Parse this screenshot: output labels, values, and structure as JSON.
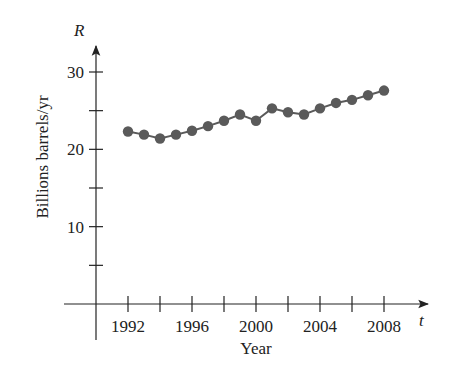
{
  "chart_data": {
    "type": "line",
    "title": "",
    "xlabel": "Year",
    "ylabel": "Billions barrels/yr",
    "x_axis_var": "t",
    "y_axis_var": "R",
    "x": [
      1992,
      1993,
      1994,
      1995,
      1996,
      1997,
      1998,
      1999,
      2000,
      2001,
      2002,
      2003,
      2004,
      2005,
      2006,
      2007,
      2008
    ],
    "series": [
      {
        "name": "R",
        "values": [
          22.3,
          21.9,
          21.4,
          21.9,
          22.4,
          23.0,
          23.7,
          24.5,
          23.7,
          25.3,
          24.8,
          24.5,
          25.3,
          26.0,
          26.4,
          27.0,
          27.6
        ]
      }
    ],
    "x_ticks": [
      1992,
      1994,
      1996,
      1998,
      2000,
      2002,
      2004,
      2006,
      2008
    ],
    "x_tick_labels": [
      "1992",
      "1996",
      "2000",
      "2004",
      "2008"
    ],
    "y_ticks": [
      5,
      10,
      15,
      20,
      25,
      30
    ],
    "y_tick_labels": [
      "10",
      "20",
      "30"
    ],
    "xlim": [
      1990,
      2010
    ],
    "ylim": [
      0,
      33
    ],
    "grid": false,
    "legend": null,
    "colors": {
      "marker": "#5a5a5a",
      "line": "#5a5a5a",
      "axis": "#222222"
    }
  }
}
